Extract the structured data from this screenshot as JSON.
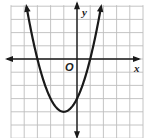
{
  "chart_data": {
    "type": "line",
    "title": "",
    "function": "y = x^2 + 2x - 3",
    "xlabel": "x",
    "ylabel": "y",
    "origin_label": "O",
    "xlim": [
      -5,
      5
    ],
    "ylim": [
      -6,
      4
    ],
    "grid": true,
    "grid_step": 1,
    "tick_labels": false,
    "series": [
      {
        "name": "parabola",
        "x_intercepts": [
          -3,
          1
        ],
        "y_intercept": -3,
        "vertex": [
          -1,
          -4
        ],
        "opens": "up",
        "points": [
          [
            -3.83,
            4
          ],
          [
            -3,
            0
          ],
          [
            -2,
            -3
          ],
          [
            -1,
            -4
          ],
          [
            0,
            -3
          ],
          [
            1,
            0
          ],
          [
            1.83,
            4
          ]
        ]
      }
    ],
    "colors": {
      "grid": "#bdbdbd",
      "axes": "#1a1a1a",
      "curve": "#1a1a1a",
      "background": "#ffffff"
    }
  }
}
